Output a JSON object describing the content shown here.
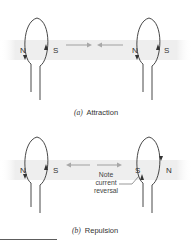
{
  "panels": [
    {
      "id": "a",
      "caption_letter": "(a)",
      "caption_text": "Attraction",
      "left_loop": {
        "left_pole": "N",
        "right_pole": "S"
      },
      "right_loop": {
        "left_pole": "N",
        "right_pole": "S"
      },
      "force": "attraction"
    },
    {
      "id": "b",
      "caption_letter": "(b)",
      "caption_text": "Repulsion",
      "left_loop": {
        "left_pole": "N",
        "right_pole": "S"
      },
      "right_loop": {
        "left_pole": "S",
        "right_pole": "N"
      },
      "force": "repulsion",
      "annotation": [
        "Note",
        "current",
        "reversal"
      ]
    }
  ],
  "colors": {
    "wire": "#333333",
    "band": "#ececec",
    "force_arrow": "#a8a8a8"
  }
}
